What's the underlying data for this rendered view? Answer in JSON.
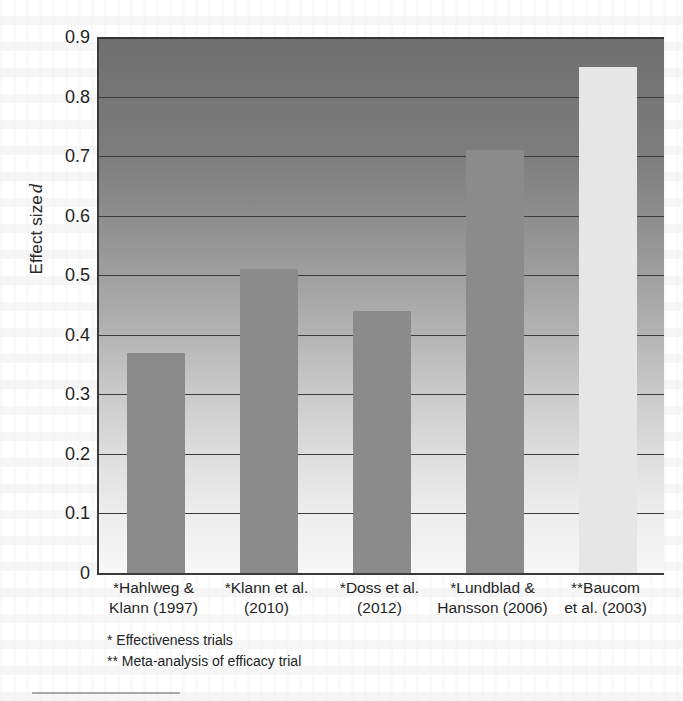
{
  "chart_data": {
    "type": "bar",
    "title": "",
    "xlabel": "",
    "ylabel": "Effect size d",
    "ylabel_plain": "Effect size",
    "ylabel_italic": "d",
    "ylim": [
      0,
      0.9
    ],
    "ytick_step": 0.1,
    "grid": true,
    "legend": "none",
    "categories": [
      "*Hahlweg & Klann (1997)",
      "*Klann et al. (2010)",
      "*Doss et al. (2012)",
      "*Lundblad & Hansson (2006)",
      "**Baucom et al. (2003)"
    ],
    "category_lines": [
      [
        "*Hahlweg &",
        "Klann (1997)"
      ],
      [
        "*Klann et al.",
        "(2010)"
      ],
      [
        "*Doss et al.",
        "(2012)"
      ],
      [
        "*Lundblad &",
        "Hansson (2006)"
      ],
      [
        "**Baucom",
        "et al. (2003)"
      ]
    ],
    "values": [
      0.37,
      0.51,
      0.44,
      0.71,
      0.85
    ],
    "ytick_labels": [
      "0.9",
      "0.8",
      "0.7",
      "0.6",
      "0.5",
      "0.4",
      "0.3",
      "0.2",
      "0.1",
      "0"
    ],
    "ytick_values": [
      0.9,
      0.8,
      0.7,
      0.6,
      0.5,
      0.4,
      0.3,
      0.2,
      0.1,
      0
    ],
    "bar_colors": [
      "#8b8b8b",
      "#8b8b8b",
      "#8b8b8b",
      "#8b8b8b",
      "#e6e6e6"
    ],
    "plot_background": "vertical gradient dark-gray to white",
    "plot_bg_top_color": "#6f6f6f",
    "plot_bg_bottom_color": "#f7f7f7",
    "gridline_color": "#3c3c3c",
    "axis_color": "#3a3a3a"
  },
  "footnotes": [
    "*  Effectiveness trials",
    "** Meta-analysis of efficacy trial"
  ],
  "footnote_items": {
    "effectiveness": "* Effectiveness trials",
    "meta_analysis": "** Meta-analysis of efficacy trial"
  }
}
